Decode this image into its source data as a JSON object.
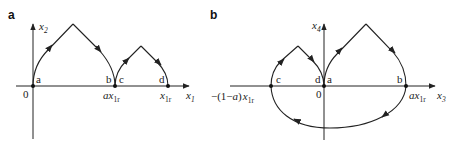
{
  "panel_a": {
    "label": "a",
    "y_axis_label": "x",
    "y_axis_sub": "2",
    "x_axis_label": "x",
    "x_axis_sub": "1",
    "origin_label": "0",
    "point_a": "a",
    "point_b": "b",
    "point_c": "c",
    "point_d": "d",
    "tick_mid_prefix": "a",
    "tick_mid_var": "x",
    "tick_mid_sub": "1r",
    "tick_end_var": "x",
    "tick_end_sub": "1r"
  },
  "panel_b": {
    "label": "b",
    "y_axis_label": "x",
    "y_axis_sub": "4",
    "x_axis_label": "x",
    "x_axis_sub": "3",
    "origin_label": "0",
    "point_a": "a",
    "point_b": "b",
    "point_c": "c",
    "point_d": "d",
    "tick_left_prefix": "−(1−",
    "tick_left_a": "a",
    "tick_left_close": ")",
    "tick_left_var": "x",
    "tick_left_sub": "1r",
    "tick_right_prefix": "a",
    "tick_right_var": "x",
    "tick_right_sub": "1r"
  },
  "colors": {
    "stroke": "#222222",
    "background": "#ffffff"
  }
}
